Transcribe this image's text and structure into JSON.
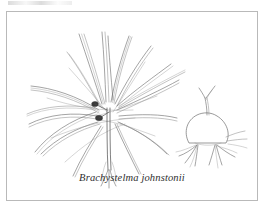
{
  "page": {
    "background_color": "#ffffff",
    "width": 272,
    "height": 213
  },
  "plate": {
    "frame_color": "#b9b9b9",
    "ink_color": "#6b6b6b",
    "flower_color": "#3a3a3a",
    "caption": "Brachystelma johnstonii",
    "illustration_name": "botanical-line-drawing",
    "subjects": [
      {
        "name": "whole-plant",
        "description": "rosette of long narrow arching linear leaves radiating from a central crown with small dark flower clusters at the base"
      },
      {
        "name": "tuber-detail",
        "description": "rounded underground tuber with forked emerging shoot and clusters of fibrous roots"
      }
    ]
  }
}
